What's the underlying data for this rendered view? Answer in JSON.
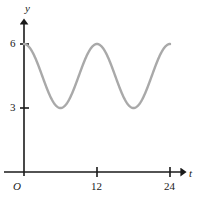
{
  "chart_data": {
    "type": "line",
    "title": "",
    "xlabel": "t",
    "ylabel": "y",
    "origin_label": "O",
    "grid": false,
    "legend": null,
    "xlim": [
      0,
      25.5
    ],
    "ylim": [
      0,
      7.2
    ],
    "x_ticks": [
      12,
      24
    ],
    "x_tick_labels": [
      "12",
      "24"
    ],
    "y_ticks": [
      3,
      6
    ],
    "y_tick_labels": [
      "3",
      "6"
    ],
    "curve_color": "#a9a9a9",
    "axis_color": "#1a1a1a",
    "series": [
      {
        "name": "y(t)",
        "description": "sinusoid, midline 4.5, amplitude 1.5, period 12, maximum at t=0",
        "equation": "y = 4.5 + 1.5*cos(pi*t/6)",
        "midline": 4.5,
        "amplitude": 1.5,
        "period": 12,
        "maximum": 6,
        "minimum": 3,
        "t_start": 0,
        "t_end": 24,
        "maxima_at": [
          0,
          12,
          24
        ],
        "minima_at": [
          6,
          18
        ],
        "x": [
          0,
          1,
          2,
          3,
          4,
          5,
          6,
          7,
          8,
          9,
          10,
          11,
          12,
          13,
          14,
          15,
          16,
          17,
          18,
          19,
          20,
          21,
          22,
          23,
          24
        ],
        "values": [
          6.0,
          5.8,
          5.25,
          4.5,
          3.75,
          3.2,
          3.0,
          3.2,
          3.75,
          4.5,
          5.25,
          5.8,
          6.0,
          5.8,
          5.25,
          4.5,
          3.75,
          3.2,
          3.0,
          3.2,
          3.75,
          4.5,
          5.25,
          5.8,
          6.0
        ]
      }
    ]
  },
  "labels": {
    "y_axis": "y",
    "t_axis": "t",
    "origin": "O",
    "y_tick_6": "6",
    "y_tick_3": "3",
    "x_tick_12": "12",
    "x_tick_24": "24"
  }
}
